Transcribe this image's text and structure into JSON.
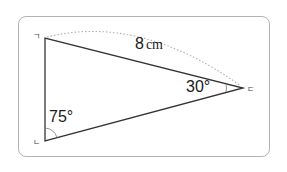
{
  "figure": {
    "type": "triangle",
    "vertices": [
      {
        "label": "ㄱ",
        "position": "top-left"
      },
      {
        "label": "ㄴ",
        "position": "bottom-left"
      },
      {
        "label": "ㄷ",
        "position": "right"
      }
    ],
    "side_length": {
      "value": "8",
      "unit": "cm",
      "side": "ㄱㄷ"
    },
    "angles": [
      {
        "vertex": "ㄷ",
        "value": "30°"
      },
      {
        "vertex": "ㄴ",
        "value": "75°"
      }
    ],
    "colors": {
      "stroke": "#333333",
      "frame": "#b4b4b4",
      "dotted_arc": "#aaaaaa",
      "text": "#1a1a1a"
    }
  }
}
